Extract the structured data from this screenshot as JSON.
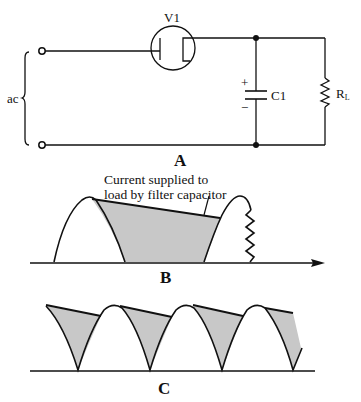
{
  "figure": {
    "panels": [
      {
        "id": "A",
        "label": "A",
        "type": "circuit-schematic"
      },
      {
        "id": "B",
        "label": "B",
        "type": "waveform"
      },
      {
        "id": "C",
        "label": "C",
        "type": "waveform"
      }
    ]
  },
  "circuit": {
    "source_label": "ac",
    "tube_label": "V1",
    "capacitor_label": "C1",
    "capacitor_plus": "+",
    "capacitor_minus": "−",
    "load_label_main": "R",
    "load_label_sub": "L"
  },
  "waveform_b": {
    "annotation_line1": "Current supplied to",
    "annotation_line2": "load by filter capacitor",
    "description": "Half-wave rectified pulse with capacitor discharge region shaded"
  },
  "waveform_c": {
    "description": "Full-wave rectified pulses with capacitor discharge regions shaded"
  },
  "colors": {
    "line": "#111111",
    "shade": "#c8c8c8",
    "background": "#ffffff"
  }
}
